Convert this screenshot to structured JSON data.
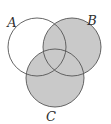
{
  "figure": {
    "name": "venn-diagram",
    "kind": "three-circle-venn",
    "background_color": "#ffffff"
  },
  "style": {
    "shaded_fill": "#c9c9c9",
    "unshaded_fill": "#ffffff",
    "stroke_color": "#555555",
    "stroke_width": "0.9",
    "label_color": "#2e2e2e"
  },
  "sets": [
    {
      "id": "A",
      "label": "A",
      "label_x": 12,
      "label_y": 27,
      "cx": 37,
      "cy": 47,
      "r": 29,
      "shaded": false
    },
    {
      "id": "B",
      "label": "B",
      "label_x": 92,
      "label_y": 25,
      "cx": 72,
      "cy": 47,
      "r": 29,
      "shaded": true
    },
    {
      "id": "C",
      "label": "C",
      "label_x": 51,
      "label_y": 121,
      "cx": 55,
      "cy": 78,
      "r": 29,
      "shaded": true
    }
  ],
  "shaded_regions": [
    "B only",
    "C only",
    "A and B",
    "A and C",
    "B and C",
    "A and B and C"
  ],
  "unshaded_regions": [
    "A only",
    "outside all sets"
  ]
}
